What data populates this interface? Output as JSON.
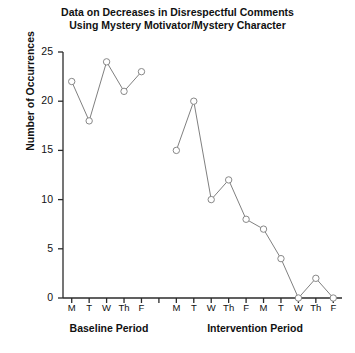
{
  "chart_data": {
    "type": "line",
    "title": "Data on Decreases in Disrespectful Comments Using Mystery Motivator/Mystery Character",
    "title_line1": "Data on Decreases in Disrespectful Comments",
    "title_line2": "Using Mystery Motivator/Mystery Character",
    "xlabel": "",
    "ylabel": "Number of Occurrences",
    "ylim": [
      0,
      25
    ],
    "ytick_labels": [
      "0",
      "5",
      "10",
      "15",
      "20",
      "25"
    ],
    "ytick_values": [
      0,
      5,
      10,
      15,
      20,
      25
    ],
    "grid": false,
    "legend": "none",
    "marker": "open-circle",
    "categories": [
      "M",
      "T",
      "W",
      "Th",
      "F",
      "",
      "M",
      "T",
      "W",
      "Th",
      "F",
      "M",
      "T",
      "W",
      "Th",
      "F"
    ],
    "phases": [
      {
        "name": "Baseline Period",
        "categories": [
          "M",
          "T",
          "W",
          "Th",
          "F"
        ],
        "values": [
          22,
          18,
          24,
          21,
          23
        ]
      },
      {
        "name": "Intervention Period",
        "categories": [
          "M",
          "T",
          "W",
          "Th",
          "F",
          "M",
          "T",
          "W",
          "Th",
          "F"
        ],
        "values": [
          15,
          20,
          10,
          12,
          8,
          7,
          4,
          0,
          2,
          0
        ]
      }
    ],
    "series": [
      {
        "name": "Baseline Period",
        "x": [
          0,
          1,
          2,
          3,
          4
        ],
        "values": [
          22,
          18,
          24,
          21,
          23
        ]
      },
      {
        "name": "Intervention Period",
        "x": [
          6,
          7,
          8,
          9,
          10,
          11,
          12,
          13,
          14,
          15
        ],
        "values": [
          15,
          20,
          10,
          12,
          8,
          7,
          4,
          0,
          2,
          0
        ]
      }
    ],
    "colors": {
      "line": "#808080",
      "marker_fill": "#ffffff",
      "marker_stroke": "#888888",
      "axis": "#2b2b2b",
      "text": "#111111"
    }
  },
  "xaxis": {
    "tick_labels": [
      "M",
      "T",
      "W",
      "Th",
      "F",
      "",
      "M",
      "T",
      "W",
      "Th",
      "F",
      "M",
      "T",
      "W",
      "Th",
      "F"
    ]
  },
  "phase_labels": {
    "baseline": "Baseline Period",
    "intervention": "Intervention Period"
  }
}
